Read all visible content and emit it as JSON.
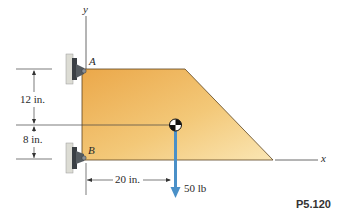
{
  "diagram": {
    "axes": {
      "x_label": "x",
      "y_label": "y"
    },
    "supports": {
      "top_label": "A",
      "bottom_label": "B"
    },
    "dimensions": {
      "vertical_top": "12 in.",
      "vertical_bottom": "8 in.",
      "horizontal": "20 in."
    },
    "load": {
      "label": "50 lb"
    },
    "problem_number": "P5.120",
    "colors": {
      "plate_light": "#f6dc9c",
      "plate_dark": "#e9a94a",
      "force_arrow": "#4a90c8",
      "lines": "#333333"
    }
  }
}
